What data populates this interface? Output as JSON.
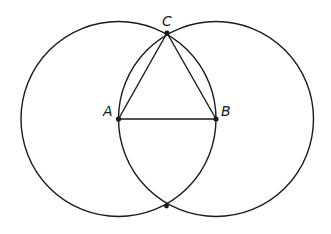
{
  "diagram": {
    "type": "geometric-construction",
    "stroke_color": "#1a1a1a",
    "points": {
      "A": {
        "label": "A",
        "x": 118.5,
        "y": 119
      },
      "B": {
        "label": "B",
        "x": 216,
        "y": 119
      },
      "C": {
        "label": "C",
        "x": 167,
        "y": 33
      },
      "D": {
        "label": "",
        "x": 166.5,
        "y": 206
      }
    },
    "circles": [
      {
        "name": "circle-centered-A",
        "cx": 118.5,
        "cy": 119,
        "r": 97.5
      },
      {
        "name": "circle-centered-B",
        "cx": 216,
        "cy": 119,
        "r": 97.5
      }
    ],
    "segments": [
      "AB",
      "AC",
      "BC"
    ]
  }
}
